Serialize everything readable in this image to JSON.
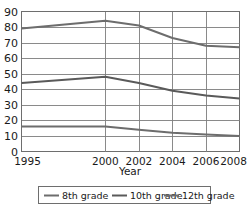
{
  "chart_data": {
    "type": "line",
    "title": "",
    "xlabel": "Year",
    "ylabel": "",
    "x": [
      1995,
      2000,
      2002,
      2004,
      2006,
      2008
    ],
    "xtick_labels": [
      "1995",
      "2000",
      "2002",
      "2004",
      "2006",
      "2008"
    ],
    "xlim": [
      1995,
      2008
    ],
    "ylim": [
      0,
      90
    ],
    "ytick_labels": [
      "0",
      "10",
      "20",
      "30",
      "40",
      "50",
      "60",
      "70",
      "80",
      "90"
    ],
    "yticks": [
      0,
      10,
      20,
      30,
      40,
      50,
      60,
      70,
      80,
      90
    ],
    "grid": "horizontal-and-vertical",
    "legend_position": "below-axes",
    "series": [
      {
        "name": "8th grade",
        "values": [
          16,
          16,
          14,
          12,
          11,
          10
        ],
        "color": "#6d6d6d"
      },
      {
        "name": "10th grade",
        "values": [
          44,
          48,
          44,
          39,
          36,
          34
        ],
        "color": "#5a5a5a"
      },
      {
        "name": "12th grade",
        "values": [
          79,
          84,
          81,
          73,
          68,
          67
        ],
        "color": "#6d6d6d"
      }
    ]
  },
  "legend": {
    "items": [
      {
        "label": "8th grade"
      },
      {
        "label": "10th grade"
      },
      {
        "label": "12th grade"
      }
    ]
  },
  "axes": {
    "x_title": "Year"
  }
}
